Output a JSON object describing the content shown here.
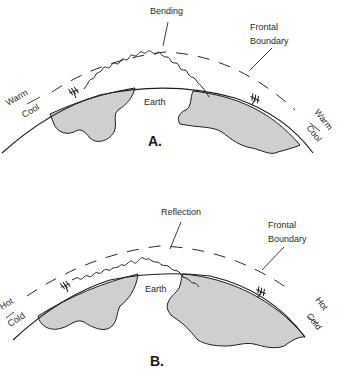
{
  "figure": {
    "panels": [
      {
        "id": "A",
        "label": "A.",
        "phenomenon_label": "Bending",
        "boundary_label_line1": "Frontal",
        "boundary_label_line2": "Boundary",
        "upper_layer_label": "Warm",
        "lower_layer_label": "Cool",
        "earth_label": "Earth"
      },
      {
        "id": "B",
        "label": "B.",
        "phenomenon_label": "Reflection",
        "boundary_label_line1": "Frontal",
        "boundary_label_line2": "Boundary",
        "upper_layer_label": "Hot",
        "lower_layer_label": "Cold",
        "earth_label": "Earth"
      }
    ],
    "colors": {
      "land_fill": "#cfcfcf",
      "line": "#1e1e1e",
      "background": "#ffffff"
    },
    "icons": [
      "antenna-icon",
      "antenna-icon"
    ]
  }
}
